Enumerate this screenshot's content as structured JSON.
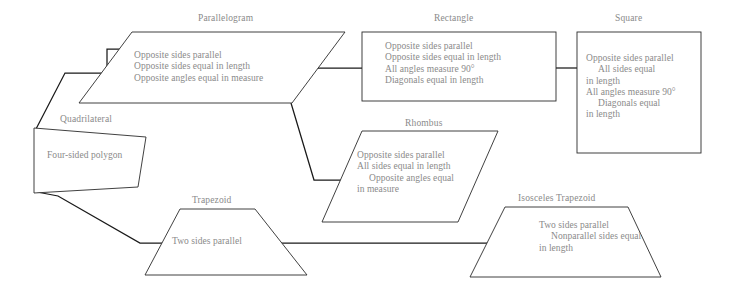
{
  "diagram": {
    "type": "quadrilateral-classification-hierarchy",
    "nodes": [
      {
        "id": "quadrilateral",
        "title": "Quadrilateral",
        "shape": "irregular-quadrilateral",
        "lines": [
          "Four-sided polygon"
        ]
      },
      {
        "id": "parallelogram",
        "title": "Parallelogram",
        "shape": "parallelogram",
        "lines": [
          "Opposite sides parallel",
          "Opposite sides equal in length",
          "Opposite angles equal in measure"
        ]
      },
      {
        "id": "rectangle",
        "title": "Rectangle",
        "shape": "rectangle",
        "lines": [
          "Opposite sides parallel",
          "Opposite sides equal in length",
          "All angles measure 90°",
          "Diagonals equal in length"
        ]
      },
      {
        "id": "square",
        "title": "Square",
        "shape": "square",
        "lines": [
          "Opposite sides parallel",
          "All sides equal",
          "in length",
          "All angles measure 90°",
          "Diagonals equal",
          "in length"
        ],
        "indented_lines": [
          2,
          5
        ]
      },
      {
        "id": "rhombus",
        "title": "Rhombus",
        "shape": "rhombus",
        "lines": [
          "Opposite sides parallel",
          "All sides equal in length",
          "Opposite angles equal",
          "in measure"
        ],
        "indented_lines": [
          3
        ]
      },
      {
        "id": "trapezoid",
        "title": "Trapezoid",
        "shape": "trapezoid",
        "lines": [
          "Two sides parallel"
        ]
      },
      {
        "id": "isosceles-trapezoid",
        "title": "Isosceles Trapezoid",
        "shape": "trapezoid",
        "lines": [
          "Two sides parallel",
          "Nonparallel sides equal",
          "in length"
        ],
        "indented_lines": [
          2
        ]
      }
    ],
    "edges": [
      {
        "from": "quadrilateral",
        "to": "parallelogram"
      },
      {
        "from": "quadrilateral",
        "to": "trapezoid"
      },
      {
        "from": "parallelogram",
        "to": "rectangle"
      },
      {
        "from": "parallelogram",
        "to": "rhombus"
      },
      {
        "from": "rectangle",
        "to": "square"
      },
      {
        "from": "trapezoid",
        "to": "isosceles-trapezoid"
      }
    ],
    "colors": {
      "background": "#ffffff",
      "shape_stroke": "#2b2b2b",
      "connector_stroke": "#1a1a1a",
      "text": "#8a8a8a"
    }
  }
}
